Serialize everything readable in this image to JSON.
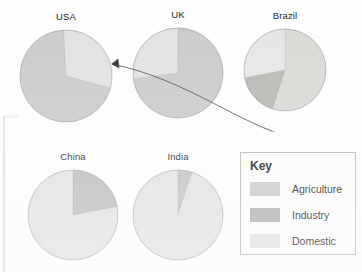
{
  "figure": {
    "background_color": "#fefefe"
  },
  "key": {
    "title": "Key",
    "items": [
      {
        "label": "Agriculture",
        "color": "#c9cbc8"
      },
      {
        "label": "Industry",
        "color": "#aeb0ad"
      },
      {
        "label": "Domestic",
        "color": "#e2e3e0"
      }
    ]
  },
  "annotations": {
    "pen_stroke": "curved-ink-line-with-arrowhead",
    "page_edge": "scanned-page-left-edge"
  },
  "chart_data": [
    {
      "type": "pie",
      "title": "USA",
      "labels": [
        "Agriculture",
        "Industry",
        "Domestic"
      ],
      "values": [
        70,
        0,
        30
      ],
      "colors": [
        "#c9cbc8",
        "#aeb0ad",
        "#e2e3e0"
      ],
      "start_angle": -15,
      "cx": 66,
      "cy": 76,
      "r": 46
    },
    {
      "type": "pie",
      "title": "UK",
      "labels": [
        "Agriculture",
        "Industry",
        "Domestic"
      ],
      "values": [
        73,
        0,
        27
      ],
      "colors": [
        "#c9cbc8",
        "#aeb0ad",
        "#e2e3e0"
      ],
      "start_angle": 90,
      "cx": 178,
      "cy": 73,
      "r": 45
    },
    {
      "type": "pie",
      "title": "Brazil",
      "labels": [
        "Agriculture",
        "Industry",
        "Domestic"
      ],
      "values": [
        55,
        17,
        28
      ],
      "colors": [
        "#d8dad6",
        "#b5b7b3",
        "#e6e7e4"
      ],
      "start_angle": 90,
      "cx": 285,
      "cy": 70,
      "r": 41
    },
    {
      "type": "pie",
      "title": "China",
      "labels": [
        "Agriculture",
        "Industry",
        "Domestic"
      ],
      "values": [
        0,
        22,
        78
      ],
      "colors": [
        "#c9cbc8",
        "#bcbeba",
        "#e3e4e1"
      ],
      "start_angle": 90,
      "cx": 73,
      "cy": 215,
      "r": 45
    },
    {
      "type": "pie",
      "title": "India",
      "labels": [
        "Agriculture",
        "Industry",
        "Domestic"
      ],
      "values": [
        0,
        5,
        95
      ],
      "colors": [
        "#c9cbc8",
        "#c2c4c0",
        "#e3e4e1"
      ],
      "start_angle": 90,
      "cx": 178,
      "cy": 215,
      "r": 45
    }
  ]
}
